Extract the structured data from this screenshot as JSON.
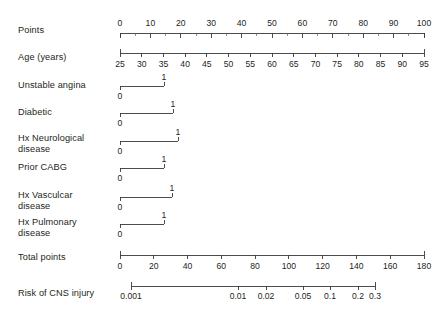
{
  "chart_data": {
    "type": "nomogram",
    "title": "",
    "subtitle": "",
    "xlabel": "",
    "ylabel": "",
    "grid": false,
    "legend_position": "none",
    "axis_color": "#3a3a3a",
    "text_color": "#231f20",
    "background": "#ffffff",
    "plot_left_px": 120,
    "plot_right_px": 424,
    "rows": [
      {
        "label": "Points",
        "kind": "scale",
        "label_side": "above",
        "axis_start_px": 120,
        "axis_end_px": 424,
        "domain": [
          0,
          100
        ],
        "major_ticks": [
          0,
          10,
          20,
          30,
          40,
          50,
          60,
          70,
          80,
          90,
          100
        ],
        "major_tick_labels": [
          "0",
          "10",
          "20",
          "30",
          "40",
          "50",
          "60",
          "70",
          "80",
          "90",
          "100"
        ],
        "minor_ticks": [
          5,
          15,
          25,
          35,
          45,
          55,
          65,
          75,
          85,
          95
        ],
        "axis_y_px": 33,
        "label_y_px": 25
      },
      {
        "label": "Age (years)",
        "kind": "scale",
        "label_side": "below",
        "axis_start_px": 120,
        "axis_end_px": 424,
        "domain": [
          25,
          95
        ],
        "major_ticks": [
          25,
          30,
          35,
          40,
          45,
          50,
          55,
          60,
          65,
          70,
          75,
          80,
          85,
          90,
          95
        ],
        "major_tick_labels": [
          "25",
          "30",
          "35",
          "40",
          "45",
          "50",
          "55",
          "60",
          "65",
          "70",
          "75",
          "80",
          "85",
          "90",
          "95"
        ],
        "minor_ticks": [],
        "axis_y_px": 53,
        "label_y_px": 52
      },
      {
        "label": "Unstable angina",
        "kind": "binary",
        "axis_start_px": 120,
        "axis_end_px": 164,
        "values": [
          "0",
          "1"
        ],
        "axis_y_px": 86,
        "label_y_px": 80
      },
      {
        "label": "Diabetic",
        "kind": "binary",
        "axis_start_px": 120,
        "axis_end_px": 173,
        "values": [
          "0",
          "1"
        ],
        "axis_y_px": 113,
        "label_y_px": 107
      },
      {
        "label": "Hx Neurological\ndisease",
        "kind": "binary",
        "axis_start_px": 120,
        "axis_end_px": 178,
        "values": [
          "0",
          "1"
        ],
        "axis_y_px": 141,
        "label_y_px": 133
      },
      {
        "label": "Prior CABG",
        "kind": "binary",
        "axis_start_px": 120,
        "axis_end_px": 164,
        "values": [
          "0",
          "1"
        ],
        "axis_y_px": 168,
        "label_y_px": 162
      },
      {
        "label": "Hx Vasculcar\ndisease",
        "kind": "binary",
        "axis_start_px": 120,
        "axis_end_px": 172,
        "values": [
          "0",
          "1"
        ],
        "axis_y_px": 197,
        "label_y_px": 190
      },
      {
        "label": "Hx Pulmonary\ndisease",
        "kind": "binary",
        "axis_start_px": 120,
        "axis_end_px": 164,
        "values": [
          "0",
          "1"
        ],
        "axis_y_px": 224,
        "label_y_px": 217
      },
      {
        "label": "Total points",
        "kind": "scale",
        "label_side": "below",
        "axis_start_px": 120,
        "axis_end_px": 424,
        "domain": [
          0,
          180
        ],
        "major_ticks": [
          0,
          20,
          40,
          60,
          80,
          100,
          120,
          140,
          160,
          180
        ],
        "major_tick_labels": [
          "0",
          "20",
          "40",
          "60",
          "80",
          "100",
          "120",
          "140",
          "160",
          "180"
        ],
        "minor_ticks": [],
        "axis_y_px": 255,
        "label_y_px": 252
      },
      {
        "label": "Risk of CNS injury",
        "kind": "log-scale",
        "label_side": "below",
        "axis_start_px": 131,
        "axis_end_px": 375,
        "domain": [
          0.001,
          0.3
        ],
        "major_ticks": [
          0.001,
          0.01,
          0.02,
          0.05,
          0.1,
          0.2,
          0.3
        ],
        "major_tick_labels": [
          "0.001",
          "0.01",
          "0.02",
          "0.05",
          "0.1",
          "0.2",
          "0.3"
        ],
        "tick_px": [
          131,
          238,
          266,
          303,
          330,
          358,
          375
        ],
        "minor_ticks": [],
        "axis_y_px": 286,
        "label_y_px": 288
      }
    ]
  },
  "labels": {
    "points": "Points",
    "age": "Age (years)",
    "unstable_angina": "Unstable angina",
    "diabetic": "Diabetic",
    "hx_neurological": "Hx Neurological\ndisease",
    "prior_cabg": "Prior CABG",
    "hx_vascular": "Hx Vasculcar\ndisease",
    "hx_pulmonary": "Hx Pulmonary\ndisease",
    "total_points": "Total points",
    "risk_cns": "Risk of CNS injury"
  }
}
